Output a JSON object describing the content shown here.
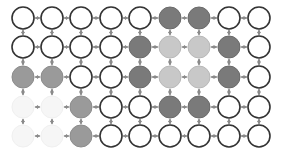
{
  "diagram": {
    "type": "grid-graph",
    "rows": 5,
    "cols": 9,
    "col_x": [
      23,
      52,
      81,
      111,
      140,
      170,
      199,
      229,
      259
    ],
    "row_y": [
      18,
      47,
      77,
      107,
      136
    ],
    "node_radius": 11,
    "legend_states": {
      "W": {
        "fill": "#ffffff",
        "stroke": "#333333"
      },
      "D": {
        "fill": "#7a7a7a",
        "stroke": "#6a6a6a"
      },
      "L": {
        "fill": "#c8c8c8",
        "stroke": "#b8b8b8"
      },
      "M": {
        "fill": "#9a9a9a",
        "stroke": "#8c8c8c"
      },
      "F": {
        "fill": "#f6f6f6",
        "stroke": "#f0f0f0"
      }
    },
    "grid": [
      [
        "W",
        "W",
        "W",
        "W",
        "W",
        "D",
        "D",
        "W",
        "W"
      ],
      [
        "W",
        "W",
        "W",
        "W",
        "D",
        "L",
        "L",
        "D",
        "W"
      ],
      [
        "M",
        "M",
        "W",
        "W",
        "D",
        "L",
        "L",
        "D",
        "W"
      ],
      [
        "F",
        "F",
        "M",
        "W",
        "W",
        "D",
        "D",
        "W",
        "W"
      ],
      [
        "F",
        "F",
        "M",
        "W",
        "W",
        "W",
        "W",
        "W",
        "W"
      ]
    ],
    "edge_color": "#8a8a8a",
    "faded_edge_color": "#9a9a9a"
  }
}
